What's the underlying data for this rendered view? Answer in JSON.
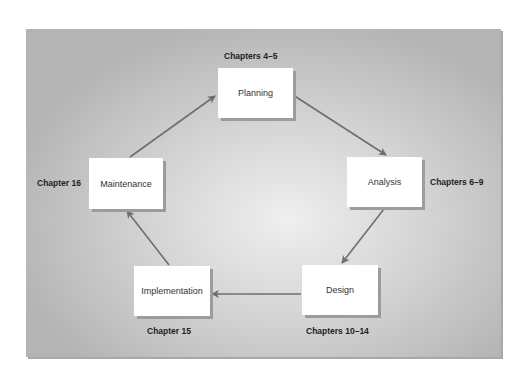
{
  "diagram": {
    "type": "cycle",
    "nodes": [
      {
        "id": "planning",
        "label": "Planning",
        "chapters": "Chapters 4–5"
      },
      {
        "id": "analysis",
        "label": "Analysis",
        "chapters": "Chapters 6–9"
      },
      {
        "id": "design",
        "label": "Design",
        "chapters": "Chapters 10–14"
      },
      {
        "id": "implementation",
        "label": "Implementation",
        "chapters": "Chapter 15"
      },
      {
        "id": "maintenance",
        "label": "Maintenance",
        "chapters": "Chapter 16"
      }
    ],
    "edges": [
      {
        "from": "planning",
        "to": "analysis"
      },
      {
        "from": "analysis",
        "to": "design"
      },
      {
        "from": "design",
        "to": "implementation"
      },
      {
        "from": "implementation",
        "to": "maintenance"
      },
      {
        "from": "maintenance",
        "to": "planning"
      }
    ],
    "colors": {
      "arrow": "#6e6e6e",
      "box": "#ffffff",
      "panel_center": "#efefef",
      "panel_edge": "#b4b4b4"
    }
  }
}
